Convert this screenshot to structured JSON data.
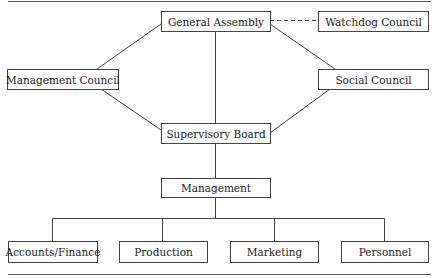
{
  "diagram": {
    "type": "organizational-chart",
    "nodes": {
      "general_assembly": "General Assembly",
      "watchdog_council": "Watchdog Council",
      "management_council": "Management Council",
      "social_council": "Social Council",
      "supervisory_board": "Supervisory Board",
      "management": "Management",
      "accounts_finance": "Accounts/Finance",
      "production": "Production",
      "marketing": "Marketing",
      "personnel": "Personnel"
    },
    "edges": [
      {
        "from": "General Assembly",
        "to": "Watchdog Council",
        "style": "dashed"
      },
      {
        "from": "General Assembly",
        "to": "Management Council",
        "style": "solid"
      },
      {
        "from": "General Assembly",
        "to": "Social Council",
        "style": "solid"
      },
      {
        "from": "General Assembly",
        "to": "Supervisory Board",
        "style": "solid"
      },
      {
        "from": "Management Council",
        "to": "Supervisory Board",
        "style": "solid"
      },
      {
        "from": "Social Council",
        "to": "Supervisory Board",
        "style": "solid"
      },
      {
        "from": "Supervisory Board",
        "to": "Management",
        "style": "solid"
      },
      {
        "from": "Management",
        "to": "Accounts/Finance",
        "style": "solid"
      },
      {
        "from": "Management",
        "to": "Production",
        "style": "solid"
      },
      {
        "from": "Management",
        "to": "Marketing",
        "style": "solid"
      },
      {
        "from": "Management",
        "to": "Personnel",
        "style": "solid"
      }
    ]
  }
}
